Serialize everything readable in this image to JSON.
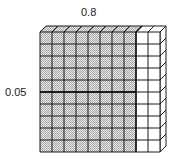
{
  "diagram": {
    "type": "decimal-grid-model",
    "labels": {
      "top": "0.8",
      "left": "0.05"
    },
    "grid": {
      "rows": 10,
      "columns": 10,
      "shaded_columns": 8,
      "bold_row_divider_after": 5,
      "bold_column_divider_after": 8
    },
    "colors": {
      "shade_dark": "#a8a8a8",
      "shade_light": "#e8e8e8",
      "line": "#1a1a1a",
      "background": "#ffffff"
    }
  }
}
